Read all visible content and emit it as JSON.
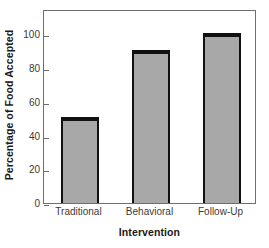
{
  "chart_data": {
    "type": "bar",
    "title": "",
    "subtitle": "",
    "xlabel": "Intervention",
    "ylabel": "Percentage of Food Accepted",
    "categories": [
      "Traditional",
      "Behavioral",
      "Follow-Up"
    ],
    "values": [
      51,
      91,
      101
    ],
    "series": [
      {
        "name": "Percentage of Food Accepted",
        "values": [
          51,
          91,
          101
        ]
      }
    ],
    "ylim": [
      0,
      115
    ],
    "yticks": [
      0,
      20,
      40,
      60,
      80,
      100
    ],
    "ytick_labels": [
      "0",
      "20",
      "40",
      "60",
      "80",
      "100"
    ],
    "xtick_labels": [
      "Traditional",
      "Behavioral",
      "Follow-Up"
    ],
    "grid": false,
    "legend": false,
    "legend_position": "none",
    "annotations": [],
    "colors": {
      "bar_fill": "#a8a8a8",
      "bar_edge": "#111111",
      "frame": "#6e6e6e",
      "text": "#1a1a1a",
      "tick_text": "#3a3a3a",
      "background": "#ffffff"
    }
  }
}
